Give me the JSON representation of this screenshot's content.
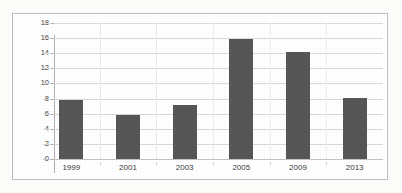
{
  "chart_data": {
    "type": "bar",
    "title": "",
    "subtitle": "",
    "xlabel": "",
    "ylabel": "",
    "categories": [
      "1999",
      "2001",
      "2003",
      "2005",
      "2009",
      "2013"
    ],
    "values": [
      7.8,
      5.8,
      7.2,
      15.9,
      14.2,
      8.05
    ],
    "series": [
      {
        "name": "Series 1",
        "values": [
          7.8,
          5.8,
          7.2,
          15.9,
          14.2,
          8.05
        ]
      }
    ],
    "ylim": [
      0,
      18
    ],
    "ytick_step": 2,
    "yticks": [
      0,
      2,
      4,
      6,
      8,
      10,
      12,
      14,
      16,
      18
    ],
    "ytick_labels": [
      "0",
      "2",
      "4",
      "6",
      "8",
      "10",
      "12",
      "14",
      "16",
      "18"
    ],
    "grid": true,
    "grid_axis": "y",
    "legend": false,
    "legend_position": "none",
    "annotations": [],
    "colors": {
      "bar": "#565656",
      "gridline": "#d9d9d9",
      "axis": "#b0b0b0",
      "frame": "#bfbfbf",
      "plot_background": "#ffffff",
      "page_background": "#fdfdfc",
      "tick_text": "#3b3b3b"
    }
  }
}
